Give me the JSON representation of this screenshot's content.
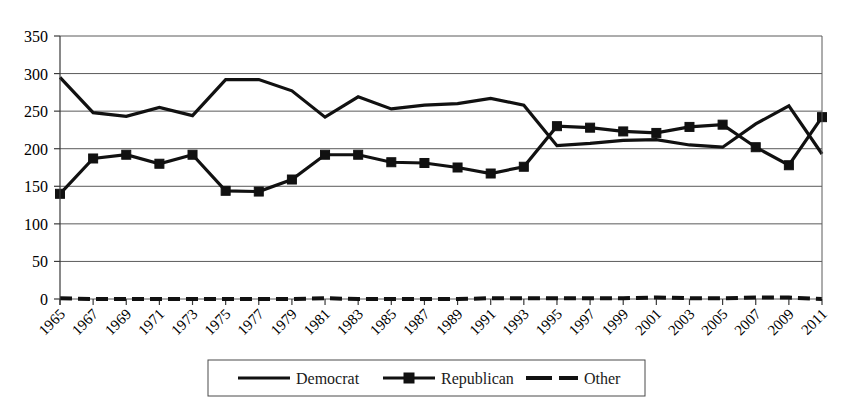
{
  "chart_data": {
    "type": "line",
    "title": "",
    "xlabel": "",
    "ylabel": "",
    "ylim": [
      0,
      350
    ],
    "ytick_values": [
      0,
      50,
      100,
      150,
      200,
      250,
      300,
      350
    ],
    "grid": true,
    "legend_position": "bottom",
    "categories": [
      "1965",
      "1967",
      "1969",
      "1971",
      "1973",
      "1975",
      "1977",
      "1979",
      "1981",
      "1983",
      "1985",
      "1987",
      "1989",
      "1991",
      "1993",
      "1995",
      "1997",
      "1999",
      "2001",
      "2003",
      "2005",
      "2007",
      "2009",
      "2011"
    ],
    "series": [
      {
        "name": "Democrat",
        "style": "solid",
        "marker": "none",
        "color": "#111111",
        "values": [
          295,
          248,
          243,
          255,
          244,
          292,
          292,
          277,
          242,
          269,
          253,
          258,
          260,
          267,
          258,
          204,
          207,
          211,
          212,
          205,
          202,
          233,
          257,
          193
        ]
      },
      {
        "name": "Republican",
        "style": "solid",
        "marker": "square",
        "color": "#111111",
        "values": [
          140,
          187,
          192,
          180,
          192,
          144,
          143,
          159,
          192,
          192,
          182,
          181,
          175,
          167,
          176,
          230,
          228,
          223,
          221,
          229,
          232,
          202,
          178,
          242
        ]
      },
      {
        "name": "Other",
        "style": "dashed",
        "marker": "none",
        "color": "#111111",
        "values": [
          1,
          0,
          0,
          0,
          0,
          0,
          0,
          0,
          1,
          0,
          0,
          0,
          0,
          1,
          1,
          1,
          1,
          1,
          2,
          1,
          1,
          2,
          2,
          0
        ]
      }
    ]
  },
  "legend": {
    "items": [
      {
        "label": "Democrat",
        "style": "solid",
        "marker": "none"
      },
      {
        "label": "Republican",
        "style": "solid",
        "marker": "square"
      },
      {
        "label": "Other",
        "style": "dashed",
        "marker": "none"
      }
    ]
  }
}
